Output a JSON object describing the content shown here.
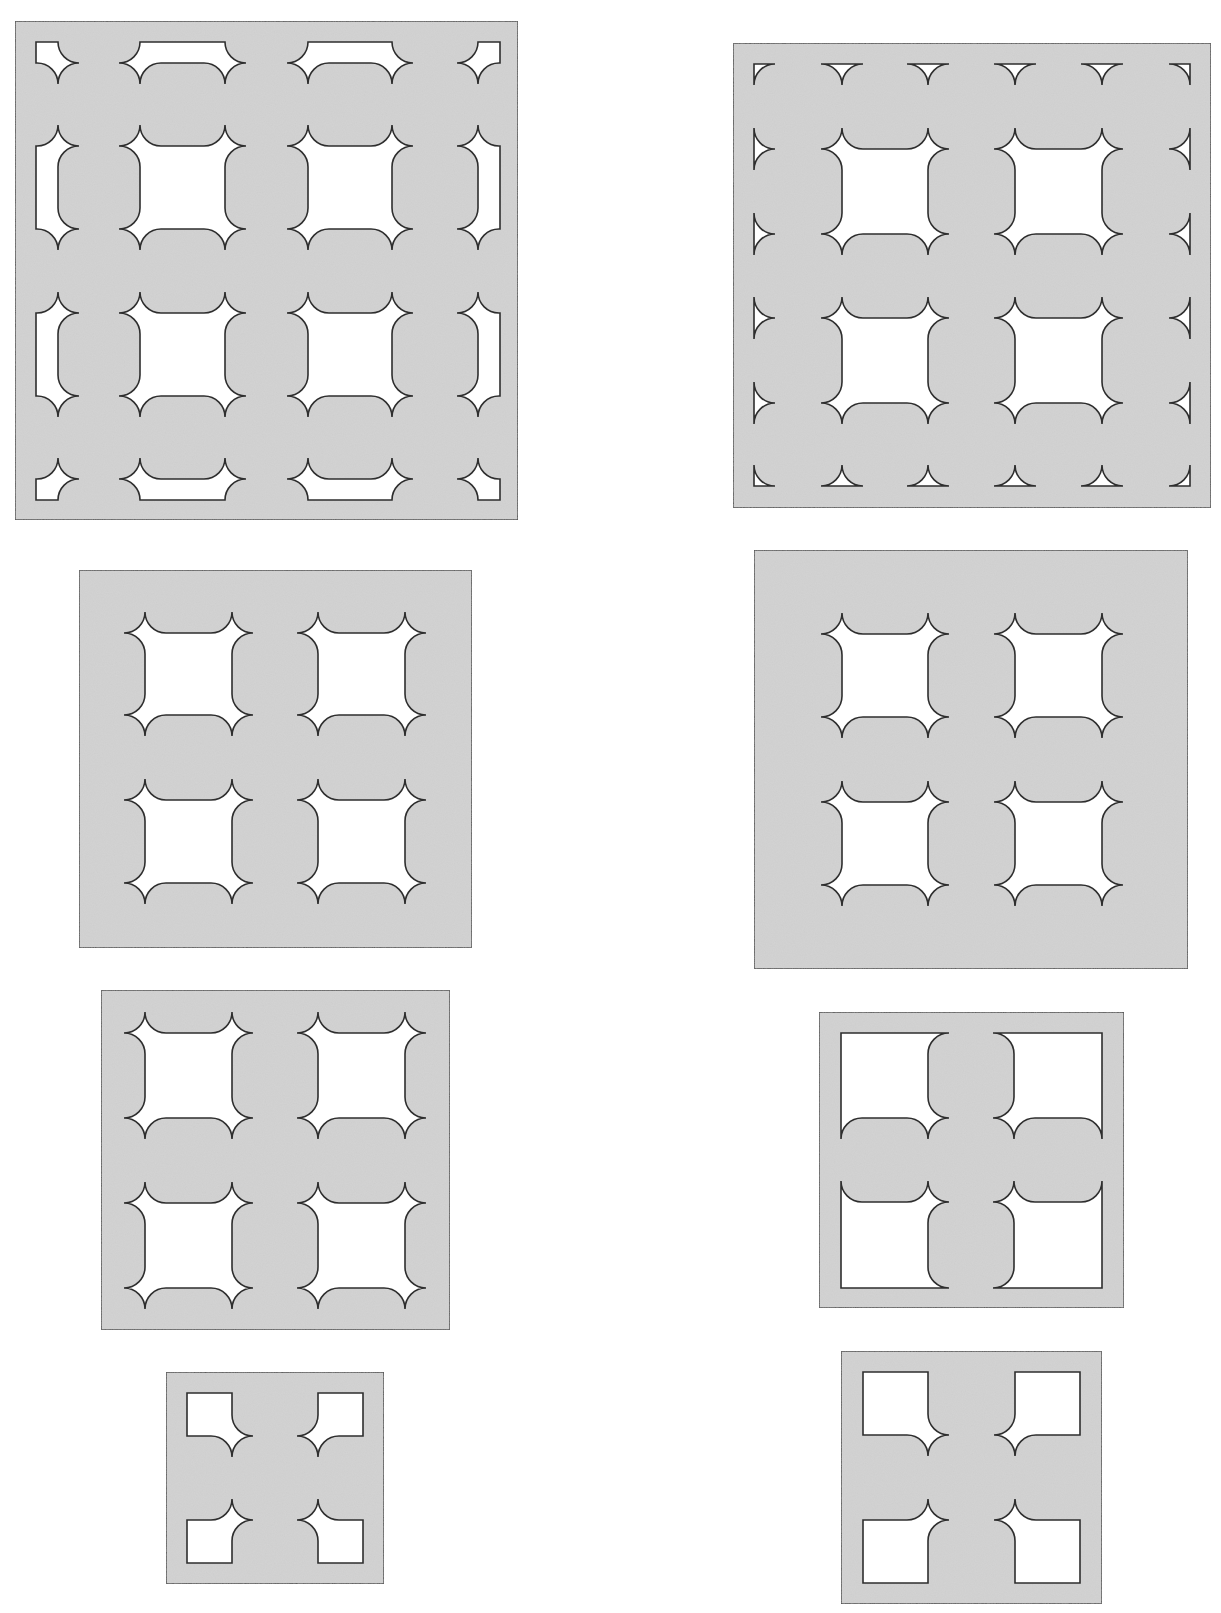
{
  "canvas": {
    "width": 1221,
    "height": 1613,
    "background": "#ffffff"
  },
  "colors": {
    "panel_fill": "#cecece",
    "outline": "#2e2e2e",
    "hole_fill": "#ffffff"
  },
  "corner_radius": 21,
  "figures": [
    {
      "id": "figure-1",
      "position": "top-left",
      "frame": [
        15,
        21,
        518,
        520
      ],
      "holes": [
        {
          "rect": [
            36,
            42,
            58,
            63
          ],
          "corners": [
            "n",
            "n",
            "s",
            "n"
          ]
        },
        {
          "rect": [
            140,
            42,
            225,
            63
          ],
          "corners": [
            "n",
            "n",
            "s",
            "s"
          ]
        },
        {
          "rect": [
            308,
            42,
            392,
            63
          ],
          "corners": [
            "n",
            "n",
            "s",
            "s"
          ]
        },
        {
          "rect": [
            478,
            42,
            500,
            63
          ],
          "corners": [
            "n",
            "n",
            "n",
            "s"
          ]
        },
        {
          "rect": [
            36,
            146,
            58,
            229
          ],
          "corners": [
            "n",
            "s",
            "s",
            "n"
          ]
        },
        {
          "rect": [
            140,
            146,
            225,
            229
          ],
          "corners": [
            "s",
            "s",
            "s",
            "s"
          ]
        },
        {
          "rect": [
            308,
            146,
            392,
            229
          ],
          "corners": [
            "s",
            "s",
            "s",
            "s"
          ]
        },
        {
          "rect": [
            478,
            146,
            500,
            229
          ],
          "corners": [
            "s",
            "n",
            "n",
            "s"
          ]
        },
        {
          "rect": [
            36,
            313,
            58,
            396
          ],
          "corners": [
            "n",
            "s",
            "s",
            "n"
          ]
        },
        {
          "rect": [
            140,
            313,
            225,
            396
          ],
          "corners": [
            "s",
            "s",
            "s",
            "s"
          ]
        },
        {
          "rect": [
            308,
            313,
            392,
            396
          ],
          "corners": [
            "s",
            "s",
            "s",
            "s"
          ]
        },
        {
          "rect": [
            478,
            313,
            500,
            396
          ],
          "corners": [
            "s",
            "n",
            "n",
            "s"
          ]
        },
        {
          "rect": [
            36,
            479,
            58,
            500
          ],
          "corners": [
            "n",
            "s",
            "n",
            "n"
          ]
        },
        {
          "rect": [
            140,
            479,
            225,
            500
          ],
          "corners": [
            "s",
            "s",
            "n",
            "n"
          ]
        },
        {
          "rect": [
            308,
            479,
            392,
            500
          ],
          "corners": [
            "s",
            "s",
            "n",
            "n"
          ]
        },
        {
          "rect": [
            478,
            479,
            500,
            500
          ],
          "corners": [
            "s",
            "n",
            "n",
            "n"
          ]
        }
      ],
      "notches": [],
      "corner_notches": []
    },
    {
      "id": "figure-2",
      "position": "top-right",
      "frame": [
        733,
        43,
        1211,
        508
      ],
      "holes": [
        {
          "rect": [
            842,
            149,
            928,
            234
          ],
          "corners": [
            "s",
            "s",
            "s",
            "s"
          ]
        },
        {
          "rect": [
            1015,
            149,
            1102,
            234
          ],
          "corners": [
            "s",
            "s",
            "s",
            "s"
          ]
        },
        {
          "rect": [
            842,
            318,
            928,
            403
          ],
          "corners": [
            "s",
            "s",
            "s",
            "s"
          ]
        },
        {
          "rect": [
            1015,
            318,
            1102,
            403
          ],
          "corners": [
            "s",
            "s",
            "s",
            "s"
          ]
        }
      ],
      "notches": [
        {
          "x": 842,
          "y": 64,
          "dir": "down"
        },
        {
          "x": 928,
          "y": 64,
          "dir": "down"
        },
        {
          "x": 1015,
          "y": 64,
          "dir": "down"
        },
        {
          "x": 1102,
          "y": 64,
          "dir": "down"
        },
        {
          "x": 842,
          "y": 486,
          "dir": "up"
        },
        {
          "x": 928,
          "y": 486,
          "dir": "up"
        },
        {
          "x": 1015,
          "y": 486,
          "dir": "up"
        },
        {
          "x": 1102,
          "y": 486,
          "dir": "up"
        },
        {
          "x": 754,
          "y": 149,
          "dir": "right"
        },
        {
          "x": 754,
          "y": 234,
          "dir": "right"
        },
        {
          "x": 754,
          "y": 318,
          "dir": "right"
        },
        {
          "x": 754,
          "y": 403,
          "dir": "right"
        },
        {
          "x": 1190,
          "y": 149,
          "dir": "left"
        },
        {
          "x": 1190,
          "y": 234,
          "dir": "left"
        },
        {
          "x": 1190,
          "y": 318,
          "dir": "left"
        },
        {
          "x": 1190,
          "y": 403,
          "dir": "left"
        }
      ],
      "corner_notches": [
        {
          "x": 754,
          "y": 64,
          "corner": "tl"
        },
        {
          "x": 1190,
          "y": 64,
          "corner": "tr"
        },
        {
          "x": 1190,
          "y": 486,
          "corner": "br"
        },
        {
          "x": 754,
          "y": 486,
          "corner": "bl"
        }
      ]
    },
    {
      "id": "figure-3",
      "position": "middle-left",
      "frame": [
        79,
        570,
        472,
        948
      ],
      "holes": [
        {
          "rect": [
            145,
            633,
            232,
            715
          ],
          "corners": [
            "s",
            "s",
            "s",
            "s"
          ]
        },
        {
          "rect": [
            318,
            633,
            405,
            715
          ],
          "corners": [
            "s",
            "s",
            "s",
            "s"
          ]
        },
        {
          "rect": [
            145,
            800,
            232,
            883
          ],
          "corners": [
            "s",
            "s",
            "s",
            "s"
          ]
        },
        {
          "rect": [
            318,
            800,
            405,
            883
          ],
          "corners": [
            "s",
            "s",
            "s",
            "s"
          ]
        }
      ],
      "notches": [],
      "corner_notches": []
    },
    {
      "id": "figure-4",
      "position": "middle-right",
      "frame": [
        754,
        550,
        1188,
        969
      ],
      "holes": [
        {
          "rect": [
            842,
            634,
            928,
            717
          ],
          "corners": [
            "s",
            "s",
            "s",
            "s"
          ]
        },
        {
          "rect": [
            1015,
            634,
            1102,
            717
          ],
          "corners": [
            "s",
            "s",
            "s",
            "s"
          ]
        },
        {
          "rect": [
            842,
            802,
            928,
            885
          ],
          "corners": [
            "s",
            "s",
            "s",
            "s"
          ]
        },
        {
          "rect": [
            1015,
            802,
            1102,
            885
          ],
          "corners": [
            "s",
            "s",
            "s",
            "s"
          ]
        }
      ],
      "notches": [],
      "corner_notches": []
    },
    {
      "id": "figure-5",
      "position": "lower-left",
      "frame": [
        101,
        990,
        450,
        1330
      ],
      "holes": [
        {
          "rect": [
            145,
            1033,
            232,
            1118
          ],
          "corners": [
            "s",
            "s",
            "s",
            "s"
          ]
        },
        {
          "rect": [
            318,
            1033,
            405,
            1118
          ],
          "corners": [
            "s",
            "s",
            "s",
            "s"
          ]
        },
        {
          "rect": [
            145,
            1203,
            232,
            1288
          ],
          "corners": [
            "s",
            "s",
            "s",
            "s"
          ]
        },
        {
          "rect": [
            318,
            1203,
            405,
            1288
          ],
          "corners": [
            "s",
            "s",
            "s",
            "s"
          ]
        }
      ],
      "notches": [],
      "corner_notches": []
    },
    {
      "id": "figure-6",
      "position": "lower-right",
      "frame": [
        819,
        1012,
        1124,
        1308
      ],
      "holes": [
        {
          "rect": [
            841,
            1033,
            928,
            1118
          ],
          "corners": [
            "n",
            "a",
            "s",
            "b"
          ]
        },
        {
          "rect": [
            1014,
            1033,
            1102,
            1118
          ],
          "corners": [
            "b",
            "n",
            "a",
            "s"
          ]
        },
        {
          "rect": [
            841,
            1202,
            928,
            1288
          ],
          "corners": [
            "a",
            "s",
            "b",
            "n"
          ]
        },
        {
          "rect": [
            1014,
            1202,
            1102,
            1288
          ],
          "corners": [
            "s",
            "b",
            "n",
            "a"
          ]
        }
      ],
      "notches": [],
      "corner_notches": []
    },
    {
      "id": "figure-7",
      "position": "bottom-left",
      "frame": [
        166,
        1372,
        384,
        1584
      ],
      "holes": [
        {
          "rect": [
            187,
            1393,
            232,
            1436
          ],
          "corners": [
            "n",
            "n",
            "s",
            "n"
          ]
        },
        {
          "rect": [
            318,
            1393,
            363,
            1436
          ],
          "corners": [
            "n",
            "n",
            "n",
            "s"
          ]
        },
        {
          "rect": [
            187,
            1520,
            232,
            1563
          ],
          "corners": [
            "n",
            "s",
            "n",
            "n"
          ]
        },
        {
          "rect": [
            318,
            1520,
            363,
            1563
          ],
          "corners": [
            "s",
            "n",
            "n",
            "n"
          ]
        }
      ],
      "notches": [],
      "corner_notches": []
    },
    {
      "id": "figure-8",
      "position": "bottom-right",
      "frame": [
        841,
        1351,
        1102,
        1604
      ],
      "holes": [
        {
          "rect": [
            863,
            1372,
            928,
            1435
          ],
          "corners": [
            "n",
            "n",
            "s",
            "n"
          ]
        },
        {
          "rect": [
            1015,
            1372,
            1080,
            1435
          ],
          "corners": [
            "n",
            "n",
            "n",
            "s"
          ]
        },
        {
          "rect": [
            863,
            1520,
            928,
            1583
          ],
          "corners": [
            "n",
            "s",
            "n",
            "n"
          ]
        },
        {
          "rect": [
            1015,
            1520,
            1080,
            1583
          ],
          "corners": [
            "s",
            "n",
            "n",
            "n"
          ]
        }
      ],
      "notches": [],
      "corner_notches": []
    }
  ]
}
